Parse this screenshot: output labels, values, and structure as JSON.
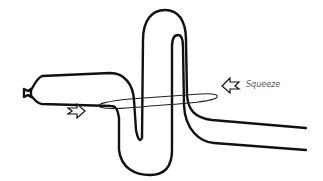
{
  "diagram": {
    "type": "balloon-tube-squeeze-illustration",
    "labels": {
      "squeeze": "Squeeze"
    },
    "elements": [
      {
        "name": "nozzle",
        "description": "balloon knot/nozzle at left end"
      },
      {
        "name": "tube",
        "description": "long balloon tube snaking up, down and up again"
      },
      {
        "name": "ring",
        "description": "elliptical squeeze ring around the middle of the tube"
      },
      {
        "name": "left-arrow",
        "description": "hollow arrow pointing right toward ring"
      },
      {
        "name": "right-arrow",
        "description": "hollow arrow pointing left toward ring, labeled Squeeze"
      }
    ],
    "colors": {
      "stroke": "#111111",
      "label": "#555555",
      "background": "#ffffff"
    }
  }
}
